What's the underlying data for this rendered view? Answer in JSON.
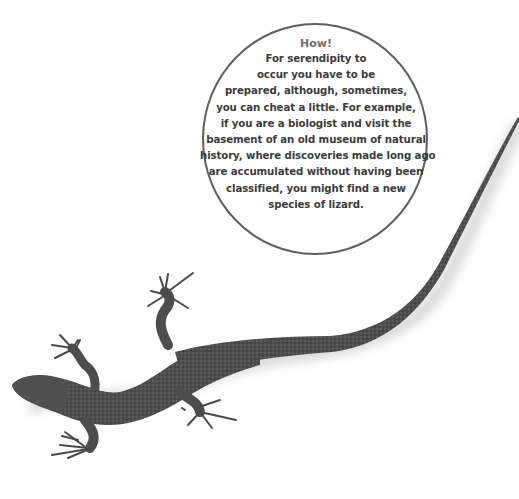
{
  "callout": {
    "title": "How!",
    "lines": [
      "For serendipity to",
      "occur you have to be",
      "prepared, although, sometimes,",
      "you can cheat a little. For example,",
      "if you are a biologist and visit the",
      "basement of an old museum of natural",
      "history, where discoveries made long ago",
      "are accumulated without having been",
      "classified, you might find a new",
      "species of lizard."
    ]
  },
  "illustration": {
    "subject": "lizard",
    "colors": {
      "body": "#4a4a4a",
      "body_light": "#6a6a6a",
      "shadow": "#d8d8d8",
      "outline": "#5f5f5f",
      "title_text": "#6e6e6e",
      "body_text": "#3b3b3b"
    }
  }
}
